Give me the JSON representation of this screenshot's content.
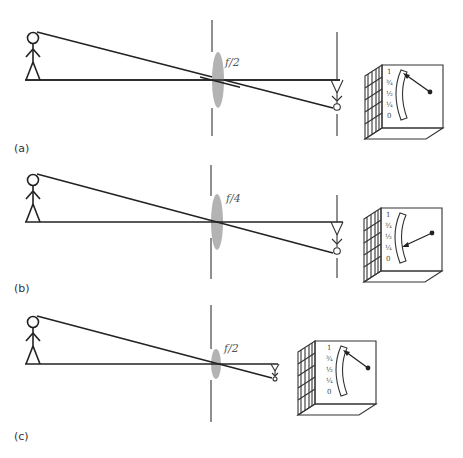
{
  "figure": {
    "panels": [
      {
        "label": "(a)",
        "f_stop": "f/2",
        "meter_reading": "1",
        "meter_scale": [
          "1",
          "¾",
          "½",
          "¼",
          "0"
        ],
        "lens_size": "large",
        "image_distance": "far"
      },
      {
        "label": "(b)",
        "f_stop": "f/4",
        "meter_reading": "¼",
        "meter_scale": [
          "1",
          "¾",
          "½",
          "¼",
          "0"
        ],
        "lens_size": "large",
        "image_distance": "far"
      },
      {
        "label": "(c)",
        "f_stop": "f/2",
        "meter_reading": "1",
        "meter_scale": [
          "1",
          "¾",
          "½",
          "¼",
          "0"
        ],
        "lens_size": "small",
        "image_distance": "near"
      }
    ]
  },
  "colors": {
    "line": "#222222",
    "lens": "#b3b3b3",
    "background": "#ffffff"
  }
}
